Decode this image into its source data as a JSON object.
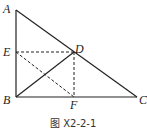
{
  "figure": {
    "caption": "图 X2-2-1",
    "points": {
      "A": {
        "label": "A",
        "x": 16,
        "y": 10
      },
      "B": {
        "label": "B",
        "x": 16,
        "y": 97
      },
      "C": {
        "label": "C",
        "x": 137,
        "y": 97
      },
      "D": {
        "label": "D",
        "x": 74,
        "y": 52
      },
      "E": {
        "label": "E",
        "x": 16,
        "y": 52
      },
      "F": {
        "label": "F",
        "x": 74,
        "y": 97
      }
    },
    "solid_segments": [
      "AB",
      "BC",
      "AC",
      "BD"
    ],
    "dashed_segments": [
      "ED",
      "DF",
      "EF"
    ],
    "stroke_color": "#222222"
  }
}
